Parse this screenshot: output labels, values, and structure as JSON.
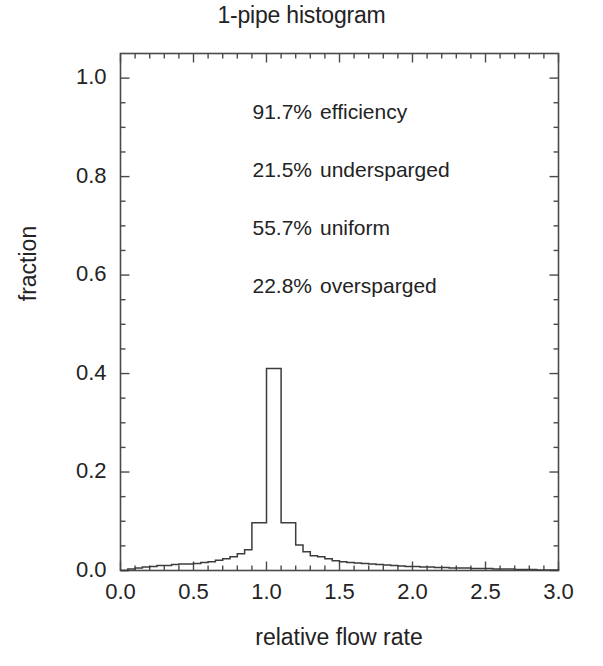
{
  "chart_data": {
    "type": "bar",
    "title": "1-pipe histogram",
    "xlabel": "relative flow rate",
    "ylabel": "fraction",
    "xlim": [
      0.0,
      3.0
    ],
    "ylim": [
      0.0,
      1.05
    ],
    "grid": false,
    "legend": "none",
    "xticks": [
      "0.0",
      "0.5",
      "1.0",
      "1.5",
      "2.0",
      "2.5",
      "3.0"
    ],
    "xtick_values": [
      0.0,
      0.5,
      1.0,
      1.5,
      2.0,
      2.5,
      3.0
    ],
    "xminor_step": 0.1,
    "yticks": [
      "0.0",
      "0.2",
      "0.4",
      "0.6",
      "0.8",
      "1.0"
    ],
    "ytick_values": [
      0.0,
      0.2,
      0.4,
      0.6,
      0.8,
      1.0
    ],
    "yminor_step": 0.05,
    "bin_width": 0.05,
    "bin_starts": [
      0.0,
      0.05,
      0.1,
      0.15,
      0.2,
      0.25,
      0.3,
      0.35,
      0.4,
      0.45,
      0.5,
      0.55,
      0.6,
      0.65,
      0.7,
      0.75,
      0.8,
      0.85,
      0.9,
      0.95,
      1.0,
      1.05,
      1.1,
      1.15,
      1.2,
      1.25,
      1.3,
      1.35,
      1.4,
      1.45,
      1.5,
      1.55,
      1.6,
      1.65,
      1.7,
      1.75,
      1.8,
      1.85,
      1.9,
      1.95,
      2.0,
      2.05,
      2.1,
      2.15,
      2.2,
      2.25,
      2.3,
      2.35,
      2.4,
      2.45,
      2.5,
      2.55,
      2.6,
      2.65,
      2.7,
      2.75,
      2.8,
      2.85,
      2.9,
      2.95
    ],
    "values": [
      0.0,
      0.003,
      0.005,
      0.007,
      0.008,
      0.01,
      0.01,
      0.012,
      0.013,
      0.013,
      0.014,
      0.016,
      0.018,
      0.021,
      0.024,
      0.028,
      0.034,
      0.042,
      0.097,
      0.097,
      0.41,
      0.41,
      0.097,
      0.097,
      0.052,
      0.038,
      0.03,
      0.028,
      0.024,
      0.02,
      0.018,
      0.016,
      0.015,
      0.014,
      0.013,
      0.012,
      0.011,
      0.01,
      0.009,
      0.008,
      0.008,
      0.007,
      0.007,
      0.006,
      0.006,
      0.005,
      0.005,
      0.005,
      0.004,
      0.004,
      0.004,
      0.003,
      0.003,
      0.003,
      0.002,
      0.002,
      0.002,
      0.001,
      0.001,
      0.001
    ],
    "annotations": [
      {
        "value": "91.7%",
        "label": "efficiency"
      },
      {
        "value": "21.5%",
        "label": "undersparged"
      },
      {
        "value": "55.7%",
        "label": "uniform"
      },
      {
        "value": "22.8%",
        "label": "oversparged"
      }
    ],
    "line_color": "#3c3c3c",
    "axis_color": "#4a4a4a",
    "text_color": "#232323",
    "background": "#ffffff"
  }
}
